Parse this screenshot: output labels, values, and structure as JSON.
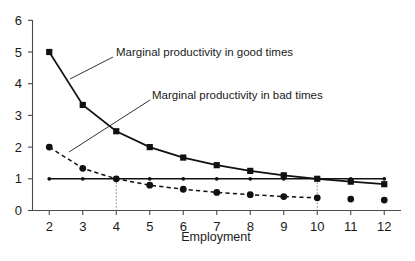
{
  "chart_data": {
    "type": "line",
    "title": "",
    "xlabel": "Employment",
    "ylabel": "",
    "xlim": [
      1.5,
      12.5
    ],
    "ylim": [
      0,
      6
    ],
    "x": [
      2,
      3,
      4,
      5,
      6,
      7,
      8,
      9,
      10,
      11,
      12
    ],
    "xticks": [
      "2",
      "3",
      "4",
      "5",
      "6",
      "7",
      "8",
      "9",
      "10",
      "11",
      "12"
    ],
    "yticks": [
      "0",
      "1",
      "2",
      "3",
      "4",
      "5",
      "6"
    ],
    "grid": false,
    "legend_position": "inline-annotations",
    "series": [
      {
        "name": "Marginal productivity in good times",
        "marker": "square",
        "linestyle": "solid",
        "color": "#111111",
        "x": [
          2,
          3,
          4,
          5,
          6,
          7,
          8,
          9,
          10,
          11,
          12
        ],
        "values": [
          5.0,
          3.33,
          2.5,
          2.0,
          1.67,
          1.43,
          1.25,
          1.11,
          1.0,
          0.91,
          0.83
        ]
      },
      {
        "name": "Marginal productivity in bad times",
        "marker": "circle",
        "linestyle": "dashed",
        "color": "#111111",
        "x": [
          2,
          3,
          4,
          5,
          6,
          7,
          8,
          9,
          10,
          11,
          12
        ],
        "values": [
          2.0,
          1.33,
          1.0,
          0.8,
          0.67,
          0.57,
          0.5,
          0.44,
          0.4,
          0.36,
          0.33
        ],
        "line_x_end": 10
      },
      {
        "name": "Reference wage line",
        "marker": "dot",
        "linestyle": "solid",
        "color": "#111111",
        "x": [
          2,
          3,
          4,
          5,
          6,
          7,
          8,
          9,
          10,
          11,
          12
        ],
        "values": [
          1.0,
          1.0,
          1.0,
          1.0,
          1.0,
          1.0,
          1.0,
          1.0,
          1.0,
          1.0,
          1.0
        ]
      }
    ],
    "annotations": [
      {
        "text": "Marginal productivity in good times",
        "target_x": 3,
        "target_y": 4.25
      },
      {
        "text": "Marginal productivity in bad times",
        "target_x": 3,
        "target_y": 1.95
      }
    ],
    "droplines": [
      {
        "x": 4,
        "y_top": 1.0
      },
      {
        "x": 10,
        "y_top": 1.0
      }
    ]
  }
}
